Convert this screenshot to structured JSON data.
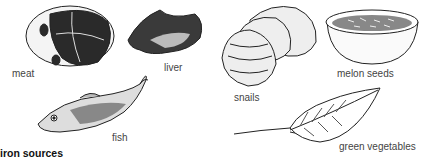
{
  "title": "iron sources",
  "items": [
    {
      "name": "meat",
      "label": "meat"
    },
    {
      "name": "liver",
      "label": "liver"
    },
    {
      "name": "snails",
      "label": "snails"
    },
    {
      "name": "melon-seeds",
      "label": "melon seeds"
    },
    {
      "name": "fish",
      "label": "fish"
    },
    {
      "name": "green-vegetables",
      "label": "green vegetables"
    }
  ]
}
